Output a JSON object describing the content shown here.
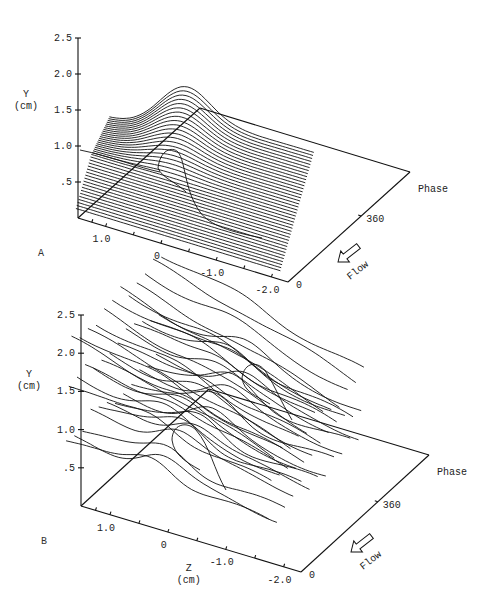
{
  "chart_data": [
    {
      "panel": "A",
      "type": "line",
      "title": "",
      "panel_label": "A",
      "plot_style": "3D waterfall of streamlines over phase",
      "ylabel": "Y",
      "ylabel_unit": "(cm)",
      "xlabel": "",
      "xlabel_unit": "",
      "phase_label": "Phase",
      "flow_label": "Flow",
      "y_ticks": [
        "2.5",
        "2.0",
        "1.5",
        "1.0",
        ".5"
      ],
      "y_tick_values": [
        2.5,
        2.0,
        1.5,
        1.0,
        0.5
      ],
      "z_ticks": [
        "1.0",
        "0",
        "-1.0",
        "-2.0"
      ],
      "z_tick_values": [
        1.0,
        0,
        -1.0,
        -2.0
      ],
      "phase_ticks": [
        "0",
        "360"
      ],
      "phase_tick_values": [
        0,
        360
      ],
      "ylim": [
        0,
        2.5
      ],
      "zlim": [
        1.5,
        -2.3
      ],
      "grid": false,
      "num_curves": 40,
      "description": "Stacked streamline curves; upper layers rise to ~1.9 cm forming a single smooth hump near Z≈0, with a closed recirculation loop near Y≈0.8 cm; lower layers flat near Y≈0.1–0.6 cm."
    },
    {
      "panel": "B",
      "type": "line",
      "title": "",
      "panel_label": "B",
      "plot_style": "3D waterfall of streamlines over phase",
      "ylabel": "Y",
      "ylabel_unit": "(cm)",
      "xlabel": "Z",
      "xlabel_unit": "(cm)",
      "phase_label": "Phase",
      "flow_label": "Flow",
      "y_ticks": [
        "2.5",
        "2.0",
        "1.5",
        "1.0",
        ".5"
      ],
      "y_tick_values": [
        2.5,
        2.0,
        1.5,
        1.0,
        0.5
      ],
      "z_ticks": [
        "1.0",
        "0",
        "-1.0",
        "-2.0"
      ],
      "z_tick_values": [
        1.0,
        0,
        -1.0,
        -2.0
      ],
      "phase_ticks": [
        "0",
        "360"
      ],
      "phase_tick_values": [
        0,
        360
      ],
      "ylim": [
        0,
        2.5
      ],
      "zlim": [
        1.5,
        -2.3
      ],
      "grid": false,
      "num_curves": 36,
      "description": "Irregular streamlines in three layers (~0.7, ~1.3, ~2.0 cm) with two closed vortex loops near Z≈0 at different phases."
    }
  ],
  "panels": {
    "A": {
      "label": "A",
      "y_title": "Y",
      "y_unit": "(cm)",
      "phase": "Phase",
      "flow": "Flow"
    },
    "B": {
      "label": "B",
      "y_title": "Y",
      "y_unit": "(cm)",
      "z_title": "Z",
      "z_unit": "(cm)",
      "phase": "Phase",
      "flow": "Flow"
    }
  }
}
